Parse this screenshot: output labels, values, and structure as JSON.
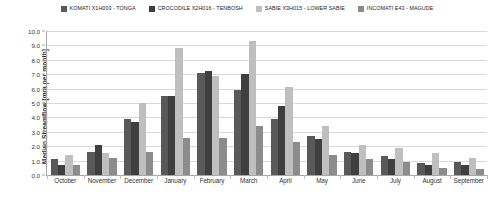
{
  "chart_data": {
    "type": "bar",
    "title": "",
    "xlabel": "",
    "ylabel": "Median Streamflow [mm per month]",
    "ylim": [
      0,
      10
    ],
    "ytick_step": 1,
    "ytick_labels": [
      "10.0",
      "9.0",
      "8.0",
      "7.0",
      "6.0",
      "5.0",
      "4.0",
      "3.0",
      "2.0",
      "1.0",
      "0.0"
    ],
    "grid": true,
    "legend_position": "top",
    "categories": [
      "October",
      "November",
      "December",
      "January",
      "February",
      "March",
      "April",
      "May",
      "June",
      "July",
      "August",
      "September"
    ],
    "series": [
      {
        "name": "KOMATI X1H003 - TONGA",
        "color": "#595959",
        "values": [
          1.1,
          1.6,
          3.9,
          5.5,
          7.1,
          5.9,
          3.9,
          2.7,
          1.6,
          1.3,
          0.8,
          0.9
        ]
      },
      {
        "name": "CROCODILE X2H016 - TENBOSH",
        "color": "#3f3f3f",
        "values": [
          0.7,
          2.1,
          3.7,
          5.5,
          7.2,
          7.0,
          4.8,
          2.5,
          1.5,
          1.1,
          0.7,
          0.7
        ]
      },
      {
        "name": "SABIE X3H015 - LOWER SABIE",
        "color": "#bfbfbf",
        "values": [
          1.4,
          1.5,
          5.0,
          8.8,
          6.9,
          9.3,
          6.1,
          3.4,
          2.1,
          1.9,
          1.5,
          1.2
        ]
      },
      {
        "name": "INCOMATI E43 - MAGUDE",
        "color": "#8c8c8c",
        "values": [
          0.7,
          1.2,
          1.6,
          2.6,
          2.6,
          3.4,
          2.3,
          1.4,
          1.1,
          0.9,
          0.5,
          0.4
        ]
      }
    ]
  }
}
